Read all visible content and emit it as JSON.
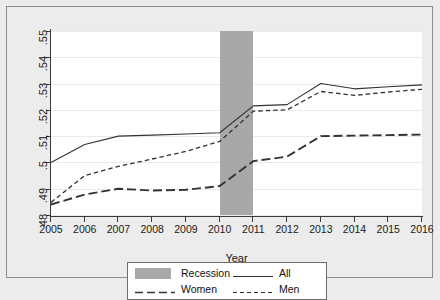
{
  "chart_data": {
    "type": "line",
    "title": "",
    "subtitle": "",
    "xlabel": "Year",
    "ylabel": "",
    "x": [
      2005,
      2006,
      2007,
      2008,
      2009,
      2010,
      2011,
      2012,
      2013,
      2014,
      2015,
      2016
    ],
    "xlim": [
      2005,
      2016
    ],
    "ylim": [
      0.48,
      0.55
    ],
    "yticks": [
      0.48,
      0.49,
      0.5,
      0.51,
      0.52,
      0.53,
      0.54,
      0.55
    ],
    "ytick_labels": [
      ".48",
      ".49",
      ".5",
      ".51",
      ".52",
      ".53",
      ".54",
      ".55"
    ],
    "xticks": [
      2005,
      2006,
      2007,
      2008,
      2009,
      2010,
      2011,
      2012,
      2013,
      2014,
      2015,
      2016
    ],
    "xtick_labels": [
      "2005",
      "2006",
      "2007",
      "2008",
      "2009",
      "2010",
      "2011",
      "2012",
      "2013",
      "2014",
      "2015",
      "2016"
    ],
    "grid": "horizontal",
    "legend_position": "below",
    "series": [
      {
        "name": "All",
        "style": "solid",
        "color": "#333333",
        "values": [
          0.5,
          0.5068,
          0.51,
          0.5104,
          0.5108,
          0.5113,
          0.5215,
          0.522,
          0.53,
          0.528,
          0.5288,
          0.5295
        ]
      },
      {
        "name": "Women",
        "style": "long-dash",
        "color": "#333333",
        "values": [
          0.484,
          0.4878,
          0.49,
          0.4893,
          0.4896,
          0.491,
          0.5005,
          0.5022,
          0.51,
          0.5102,
          0.5104,
          0.5106
        ]
      },
      {
        "name": "Men",
        "style": "short-dash",
        "color": "#333333",
        "values": [
          0.4848,
          0.495,
          0.4985,
          0.5013,
          0.5042,
          0.508,
          0.5195,
          0.52,
          0.527,
          0.5255,
          0.5268,
          0.5278
        ]
      }
    ],
    "shaded_regions": [
      {
        "name": "Recession",
        "x_start": 2010,
        "x_end": 2011,
        "color": "#a8a8a8"
      }
    ],
    "legend": [
      {
        "label": "Recession",
        "key": "swatch",
        "color": "#a8a8a8"
      },
      {
        "label": "All",
        "key": "solid",
        "color": "#333333"
      },
      {
        "label": "Women",
        "key": "long-dash",
        "color": "#333333"
      },
      {
        "label": "Men",
        "key": "short-dash",
        "color": "#333333"
      }
    ]
  },
  "colors": {
    "canvas": "#ececec",
    "plot_background": "#ffffff",
    "axis": "#3b3b3b",
    "grid": "#eaeaea",
    "recession": "#a8a8a8",
    "line": "#333333"
  }
}
